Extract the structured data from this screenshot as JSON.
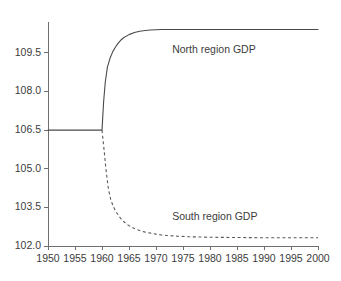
{
  "chart_data": {
    "type": "line",
    "title": "",
    "subtitle": "",
    "xlabel": "",
    "ylabel": "",
    "xlim": [
      1950,
      2000
    ],
    "ylim": [
      102.0,
      110.7
    ],
    "grid": false,
    "legend_position": "inline-annotation",
    "x_ticks": [
      1950,
      1955,
      1960,
      1965,
      1970,
      1975,
      1980,
      1985,
      1990,
      1995,
      2000
    ],
    "x_tick_labels": [
      "1950",
      "1955",
      "1960",
      "1965",
      "1970",
      "1975",
      "1980",
      "1985",
      "1990",
      "1995",
      "2000"
    ],
    "y_ticks": [
      102.0,
      103.5,
      105.0,
      106.5,
      108.0,
      109.5
    ],
    "y_tick_labels": [
      "102.0",
      "103.5",
      "105.0",
      "106.5",
      "108.0",
      "109.5"
    ],
    "annotations": [
      {
        "name": "north-series-label",
        "text": "North region GDP",
        "x": 1973,
        "y": 109.6
      },
      {
        "name": "south-series-label",
        "text": "South region GDP",
        "x": 1973,
        "y": 103.1
      }
    ],
    "series": [
      {
        "name": "North region GDP",
        "style": "solid",
        "color": "#4a4a4a",
        "x": [
          1950,
          1952,
          1954,
          1956,
          1958,
          1959,
          1960,
          1960.3,
          1960.6,
          1961,
          1961.5,
          1962,
          1962.5,
          1963,
          1963.5,
          1964,
          1965,
          1966,
          1967,
          1968,
          1969,
          1970,
          1971,
          1972,
          1974,
          1976,
          1980,
          1985,
          1990,
          1995,
          2000
        ],
        "y": [
          106.5,
          106.5,
          106.5,
          106.5,
          106.5,
          106.5,
          106.5,
          107.6,
          108.35,
          108.95,
          109.3,
          109.55,
          109.73,
          109.88,
          110.0,
          110.09,
          110.21,
          110.29,
          110.34,
          110.37,
          110.39,
          110.4,
          110.41,
          110.41,
          110.41,
          110.41,
          110.41,
          110.41,
          110.41,
          110.41,
          110.41
        ]
      },
      {
        "name": "South region GDP",
        "style": "dashed",
        "color": "#5a5a5a",
        "x": [
          1960,
          1960.4,
          1960.8,
          1961.2,
          1961.6,
          1962,
          1962.5,
          1963,
          1963.5,
          1964,
          1964.5,
          1965,
          1966,
          1967,
          1968,
          1969,
          1970,
          1971,
          1972,
          1974,
          1976,
          1978,
          1980,
          1985,
          1990,
          1995,
          2000
        ],
        "y": [
          106.5,
          105.7,
          104.85,
          104.2,
          103.82,
          103.58,
          103.36,
          103.2,
          103.06,
          102.95,
          102.86,
          102.79,
          102.68,
          102.6,
          102.54,
          102.5,
          102.46,
          102.43,
          102.41,
          102.38,
          102.36,
          102.35,
          102.34,
          102.33,
          102.32,
          102.32,
          102.32
        ]
      }
    ]
  },
  "plot_geometry": {
    "left": 48,
    "right": 318,
    "top": 22,
    "bottom": 246
  }
}
